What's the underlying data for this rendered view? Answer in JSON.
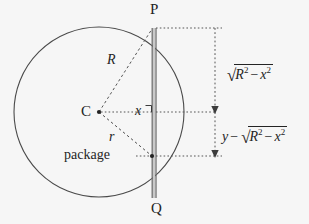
{
  "figure": {
    "type": "geometry-diagram",
    "background_color": "#f6f6f6",
    "stroke_color": "#3a3a3a",
    "dash_color": "#333333"
  },
  "labels": {
    "point_p": "P",
    "point_q": "Q",
    "center_c": "C",
    "radius_big": "R",
    "radius_small": "r",
    "half_chord_x": "x",
    "package": "package"
  },
  "expressions": {
    "upper": {
      "radicand_first": "R",
      "radicand_first_exp": "2",
      "minus": "−",
      "radicand_second": "x",
      "radicand_second_exp": "2",
      "radical_sign": "√"
    },
    "lower": {
      "lead_var": "y",
      "lead_minus": "−",
      "radicand_first": "R",
      "radicand_first_exp": "2",
      "minus": "−",
      "radicand_second": "x",
      "radicand_second_exp": "2",
      "radical_sign": "√"
    },
    "upper_plain": "sqrt(R^2 - x^2)",
    "lower_plain": "y - sqrt(R^2 - x^2)"
  },
  "geometry": {
    "circle": {
      "cx": 99,
      "cy": 112,
      "r": 85
    },
    "chord": {
      "x": 154,
      "y_top": 28,
      "y_bottom": 198
    },
    "point_p": {
      "x": 154,
      "y": 28
    },
    "point_q": {
      "x": 154,
      "y": 198
    },
    "center": {
      "x": 99,
      "y": 112
    },
    "package_point": {
      "x": 154,
      "y": 156
    },
    "measure_axis_x": 215,
    "measure_top_y": 28,
    "measure_mid_y": 112,
    "measure_bottom_y": 156
  }
}
